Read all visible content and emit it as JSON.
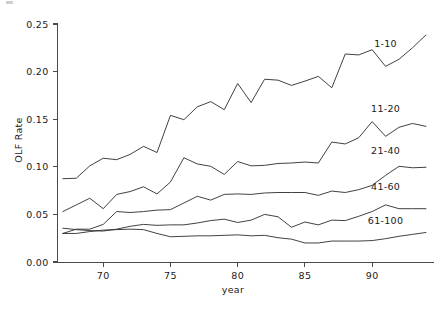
{
  "chart_data": {
    "type": "line",
    "title": "",
    "xlabel": "year",
    "ylabel": "OLF Rate",
    "xlim": [
      66.6,
      94.6
    ],
    "ylim": [
      0.0,
      0.26
    ],
    "xticks": [
      70,
      75,
      80,
      85,
      90
    ],
    "xtick_labels": [
      "70",
      "75",
      "80",
      "85",
      "90"
    ],
    "yticks": [
      0.0,
      0.05,
      0.1,
      0.15,
      0.2,
      0.25
    ],
    "ytick_labels": [
      "0.00",
      "0.05",
      "0.10",
      "0.15",
      "0.20",
      "0.25"
    ],
    "grid": false,
    "legend_position": "inline-right",
    "line_color": "#2b2b2b",
    "axis_color": "#4a4a4a",
    "x": [
      67,
      68,
      69,
      70,
      71,
      72,
      73,
      74,
      75,
      76,
      77,
      78,
      79,
      80,
      81,
      82,
      83,
      84,
      85,
      86,
      87,
      88,
      89,
      90,
      91,
      92,
      93,
      94
    ],
    "series": [
      {
        "name": "1-10",
        "label": "1-10",
        "label_x": 91.0,
        "label_y": 0.2255,
        "values": [
          0.0875,
          0.088,
          0.101,
          0.109,
          0.1075,
          0.113,
          0.1215,
          0.115,
          0.154,
          0.1495,
          0.163,
          0.1685,
          0.16,
          0.1875,
          0.1675,
          0.192,
          0.191,
          0.1855,
          0.19,
          0.195,
          0.183,
          0.2185,
          0.2175,
          0.223,
          0.2055,
          0.213,
          0.225,
          0.2385
        ]
      },
      {
        "name": "11-20",
        "label": "11-20",
        "label_x": 91.0,
        "label_y": 0.158,
        "values": [
          0.053,
          0.06,
          0.067,
          0.056,
          0.071,
          0.074,
          0.079,
          0.0715,
          0.084,
          0.1095,
          0.103,
          0.1005,
          0.092,
          0.1055,
          0.101,
          0.1015,
          0.1035,
          0.104,
          0.105,
          0.104,
          0.126,
          0.124,
          0.1305,
          0.1475,
          0.132,
          0.1415,
          0.1455,
          0.1425
        ]
      },
      {
        "name": "21-40",
        "label": "21-40",
        "label_x": 91.0,
        "label_y": 0.113,
        "values": [
          0.03,
          0.0345,
          0.0345,
          0.0395,
          0.053,
          0.052,
          0.053,
          0.0545,
          0.055,
          0.062,
          0.069,
          0.065,
          0.071,
          0.0715,
          0.071,
          0.0725,
          0.073,
          0.073,
          0.073,
          0.07,
          0.0745,
          0.073,
          0.076,
          0.0805,
          0.091,
          0.1005,
          0.099,
          0.0995
        ]
      },
      {
        "name": "41-60",
        "label": "41-60",
        "label_x": 91.0,
        "label_y": 0.0755,
        "values": [
          0.0355,
          0.034,
          0.033,
          0.0325,
          0.0345,
          0.0375,
          0.0395,
          0.0385,
          0.039,
          0.039,
          0.041,
          0.0435,
          0.045,
          0.0415,
          0.044,
          0.05,
          0.0475,
          0.0365,
          0.042,
          0.039,
          0.044,
          0.0435,
          0.048,
          0.053,
          0.06,
          0.056,
          0.056,
          0.056
        ]
      },
      {
        "name": "61-100",
        "label": "61-100",
        "label_x": 91.0,
        "label_y": 0.0395,
        "values": [
          0.03,
          0.03,
          0.032,
          0.0335,
          0.034,
          0.0345,
          0.034,
          0.03,
          0.0265,
          0.027,
          0.0275,
          0.0275,
          0.028,
          0.0285,
          0.0275,
          0.028,
          0.0255,
          0.024,
          0.02,
          0.02,
          0.022,
          0.022,
          0.022,
          0.0225,
          0.0245,
          0.027,
          0.029,
          0.031
        ]
      }
    ]
  }
}
